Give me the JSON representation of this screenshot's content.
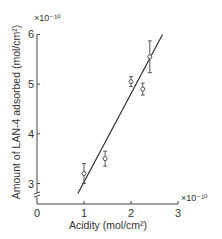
{
  "chart_data": {
    "type": "scatter",
    "title": "",
    "xlabel": "Acidity (mol/cm²)",
    "ylabel": "Amount of LAN-4 adsorbed (mol/cm²)",
    "x_multiplier": "×10⁻¹⁰",
    "y_multiplier": "×10⁻¹⁰",
    "xlim": [
      0,
      3
    ],
    "ylim": [
      2.7,
      6
    ],
    "x_ticks": [
      "0",
      "1",
      "2",
      "3"
    ],
    "y_ticks": [
      "3",
      "4",
      "5",
      "6"
    ],
    "y_axis_break": true,
    "grid": false,
    "points": [
      {
        "x": 1.0,
        "y": 3.2,
        "err": 0.2
      },
      {
        "x": 1.45,
        "y": 3.5,
        "err": 0.15
      },
      {
        "x": 2.0,
        "y": 5.05,
        "err": 0.1
      },
      {
        "x": 2.25,
        "y": 4.9,
        "err": 0.12
      },
      {
        "x": 2.4,
        "y": 5.55,
        "err": 0.32
      }
    ],
    "fit_line": {
      "x0": 0.87,
      "y0": 2.8,
      "x1": 2.67,
      "y1": 6.0
    }
  }
}
